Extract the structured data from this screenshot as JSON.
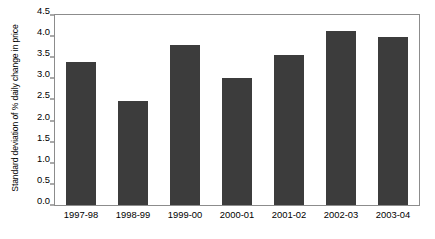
{
  "chart_data": {
    "type": "bar",
    "title": "",
    "xlabel": "",
    "ylabel": "Standard deviation of % daily change in price",
    "categories": [
      "1997-98",
      "1998-99",
      "1999-00",
      "2000-01",
      "2001-02",
      "2002-03",
      "2003-04"
    ],
    "values": [
      3.38,
      2.47,
      3.78,
      3.02,
      3.55,
      4.12,
      3.98
    ],
    "ylim": [
      0.0,
      4.5
    ],
    "ytick_labels": [
      "0.0",
      "0.5",
      "1.0",
      "1.5",
      "2.0",
      "2.5",
      "3.0",
      "3.5",
      "4.0",
      "4.5"
    ],
    "ytick_values": [
      0.0,
      0.5,
      1.0,
      1.5,
      2.0,
      2.5,
      3.0,
      3.5,
      4.0,
      4.5
    ],
    "grid": false,
    "legend": null,
    "bar_color": "#3c3c3c",
    "frame_color": "#8c8c8c",
    "background_color": "#ffffff",
    "text_color": "#000000"
  }
}
